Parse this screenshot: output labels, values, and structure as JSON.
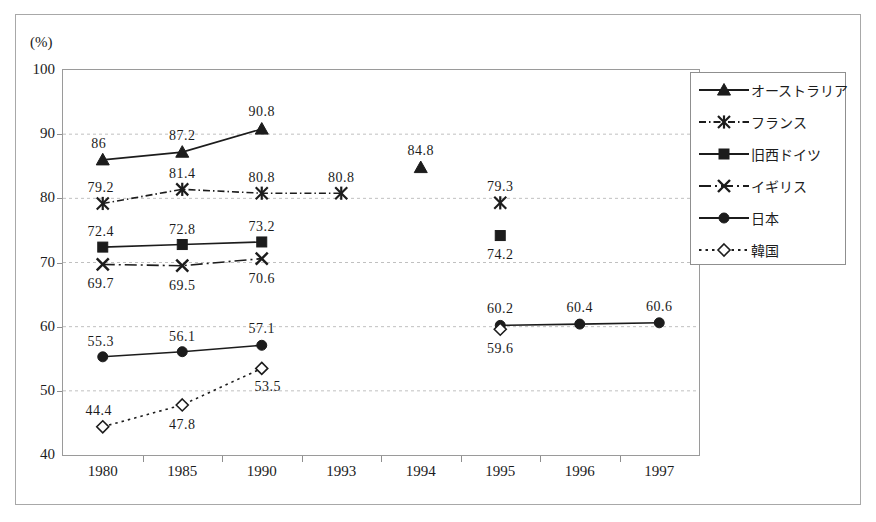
{
  "chart_data": {
    "type": "line",
    "title": "",
    "xlabel": "",
    "ylabel": "(%)",
    "ylim": [
      40,
      100
    ],
    "ytick_labels": [
      "100",
      "90",
      "80",
      "70",
      "60",
      "50",
      "40"
    ],
    "ytick_values": [
      100,
      90,
      80,
      70,
      60,
      50,
      40
    ],
    "grid": true,
    "legend_position": "right-top",
    "categories": [
      "1980",
      "1985",
      "1990",
      "1993",
      "1994",
      "1995",
      "1996",
      "1997"
    ],
    "series": [
      {
        "name": "オーストラリア",
        "marker": "triangle",
        "line_style": "solid",
        "values": [
          86,
          87.2,
          90.8,
          null,
          84.8,
          null,
          null,
          null
        ],
        "data_labels": [
          "86",
          "87.2",
          "90.8",
          "",
          "84.8",
          "",
          "",
          ""
        ]
      },
      {
        "name": "フランス",
        "marker": "asterisk",
        "line_style": "dash-dot",
        "values": [
          79.2,
          81.4,
          80.8,
          80.8,
          null,
          79.3,
          null,
          null
        ],
        "data_labels": [
          "79.2",
          "81.4",
          "80.8",
          "80.8",
          "",
          "79.3",
          "",
          ""
        ]
      },
      {
        "name": "旧西ドイツ",
        "marker": "square",
        "line_style": "solid",
        "values": [
          72.4,
          72.8,
          73.2,
          null,
          null,
          74.2,
          null,
          null
        ],
        "data_labels": [
          "72.4",
          "72.8",
          "73.2",
          "",
          "",
          "74.2",
          "",
          ""
        ]
      },
      {
        "name": "イギリス",
        "marker": "cross",
        "line_style": "dash-dot-long",
        "values": [
          69.7,
          69.5,
          70.6,
          null,
          null,
          null,
          null,
          null
        ],
        "data_labels": [
          "69.7",
          "69.5",
          "70.6",
          "",
          "",
          "",
          "",
          ""
        ]
      },
      {
        "name": "日本",
        "marker": "circle",
        "line_style": "solid",
        "values": [
          55.3,
          56.1,
          57.1,
          null,
          null,
          60.2,
          60.4,
          60.6
        ],
        "data_labels": [
          "55.3",
          "56.1",
          "57.1",
          "",
          "",
          "60.2",
          "60.4",
          "60.6"
        ]
      },
      {
        "name": "韓国",
        "marker": "diamond",
        "line_style": "dotted",
        "values": [
          44.4,
          47.8,
          53.5,
          null,
          null,
          59.6,
          null,
          null
        ],
        "data_labels": [
          "44.4",
          "47.8",
          "53.5",
          "",
          "",
          "59.6",
          "",
          ""
        ]
      }
    ]
  },
  "legend": {
    "items": [
      {
        "label": "オーストラリア",
        "marker": "triangle"
      },
      {
        "label": "フランス",
        "marker": "asterisk"
      },
      {
        "label": "旧西ドイツ",
        "marker": "square"
      },
      {
        "label": "イギリス",
        "marker": "cross"
      },
      {
        "label": "日本",
        "marker": "circle"
      },
      {
        "label": "韓国",
        "marker": "diamond"
      }
    ]
  },
  "colors": {
    "ink": "#1c1c1c",
    "axis": "#8f8f8f",
    "grid": "#c0c0c0",
    "frame": "#a8a8a8",
    "background": "#ffffff"
  }
}
